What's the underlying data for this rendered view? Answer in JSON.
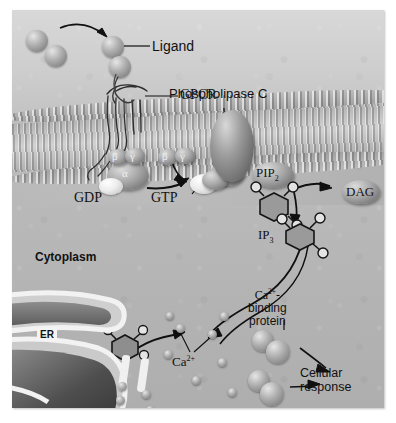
{
  "figure": {
    "style": "grayscale textbook illustration"
  },
  "labels": {
    "ligand": "Ligand",
    "gpcr": "GPCR",
    "phospholipase_c": "Phospholipase C",
    "gdp": "GDP",
    "gtp": "GTP",
    "pip2": "PIP",
    "pip2_sub": "2",
    "dag": "DAG",
    "ip3": "IP",
    "ip3_sub": "3",
    "cytoplasm": "Cytoplasm",
    "er": "ER",
    "calcium": "Ca",
    "calcium_sup": "2+",
    "ca_binding_protein_line1": "Ca",
    "ca_binding_protein_sup": "2+",
    "ca_binding_protein_dash": "-",
    "ca_binding_protein_line2": "binding",
    "ca_binding_protein_line3": "protein",
    "cellular_response_line1": "Cellular",
    "cellular_response_line2": "response",
    "g_beta": "β",
    "g_gamma": "γ",
    "g_alpha": "α",
    "g_beta_2": "β",
    "g_gamma_2": "γ"
  },
  "colors": {
    "background": "#ffffff",
    "plate": "#bdbdbd",
    "membrane": "#b4b4b4",
    "cytoplasm": "#b4b4b4",
    "ink": "#111111",
    "er_label_box": "#f4f4f4"
  },
  "structures": {
    "ligand_count": 4,
    "calcium_ion_count": 10,
    "ca_binding_protein_count": 2,
    "g_protein_subunits": [
      "alpha",
      "beta",
      "gamma"
    ]
  }
}
